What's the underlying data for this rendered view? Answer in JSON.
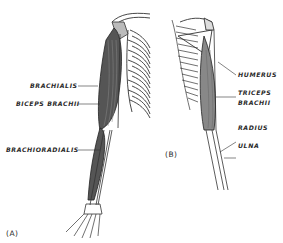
{
  "figure": {
    "panel_a": {
      "id": "(A)",
      "labels": {
        "brachialis": "BRACHIALIS",
        "biceps_brachii": "BICEPS BRACHII",
        "brachioradialis": "BRACHIORADIALIS"
      }
    },
    "panel_b": {
      "id": "(B)",
      "labels": {
        "humerus": "HUMERUS",
        "triceps_line1": "TRICEPS",
        "triceps_line2": "BRACHII",
        "radius": "RADIUS",
        "ulna": "ULNA"
      }
    },
    "colors": {
      "ink": "#2a2a2a",
      "muscle": "#555555",
      "background": "#ffffff"
    }
  }
}
